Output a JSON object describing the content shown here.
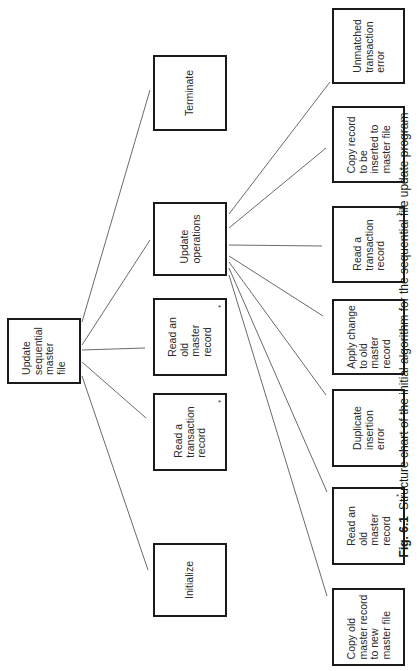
{
  "diagram": {
    "type": "structure-chart",
    "orientation": "rotated-90-ccw",
    "root": {
      "label": "Update\nsequential\nmaster\nfile",
      "iterative": false
    },
    "level2": [
      {
        "label": "Initialize",
        "iterative": false
      },
      {
        "label": "Read a\ntransaction\nrecord",
        "iterative": true
      },
      {
        "label": "Read an\nold\nmaster\nrecord",
        "iterative": true
      },
      {
        "label": "Update\noperations",
        "iterative": false
      },
      {
        "label": "Terminate",
        "iterative": false
      }
    ],
    "level3_parent": "Update operations",
    "level3": [
      {
        "label": "Copy old\nmaster record\nto new\nmaster file",
        "iterative": false
      },
      {
        "label": "Read an\nold\nmaster\nrecord",
        "iterative": true
      },
      {
        "label": "Duplicate\ninsertion\nerror",
        "iterative": false
      },
      {
        "label": "Apply change\nto old\nmaster\nrecord",
        "iterative": false
      },
      {
        "label": "Read a\ntransaction\nrecord",
        "iterative": true
      },
      {
        "label": "Copy record\nto be\ninserted to\nmaster file",
        "iterative": false
      },
      {
        "label": "Unmatched\ntransaction\nerror",
        "iterative": false
      }
    ],
    "iteration_marker": "*"
  },
  "caption": {
    "figure_number": "Fig. 6.1",
    "text": "Structure chart of the initial algorithm for the sequential file update program"
  },
  "colors": {
    "line": "#1a1a1a",
    "background": "#ffffff"
  }
}
